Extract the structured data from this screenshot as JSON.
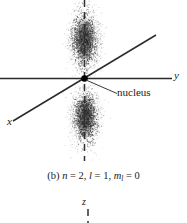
{
  "figure": {
    "kind": "atomic-orbital-electron-probability-cloud",
    "caption": {
      "part_label": "(b)",
      "full_text": "(b) n = 2, l = 1, m_l = 0",
      "quantum_numbers": [
        {
          "symbol": "n",
          "subscript": "",
          "equals": "=",
          "value": "2"
        },
        {
          "symbol": "l",
          "subscript": "",
          "equals": "=",
          "value": "1"
        },
        {
          "symbol": "m",
          "subscript": "l",
          "equals": "=",
          "value": "0"
        }
      ]
    },
    "axes": [
      {
        "name": "y-axis",
        "label": "y",
        "style": "solid",
        "orientation": "horizontal"
      },
      {
        "name": "x-axis",
        "label": "x",
        "style": "solid",
        "orientation": "diagonal"
      },
      {
        "name": "z-axis",
        "label": "z",
        "style": "dashed",
        "orientation": "vertical"
      }
    ],
    "annotations": [
      {
        "name": "nucleus",
        "text": "nucleus",
        "leader_line": true
      }
    ],
    "next_figure": {
      "axis_label": "z"
    },
    "colors": {
      "background": "#ffffff",
      "ink": "#1a1a1a",
      "axis": "#2a2a2a",
      "cloud": "#4a4a4a",
      "nucleus": "#000000"
    }
  }
}
